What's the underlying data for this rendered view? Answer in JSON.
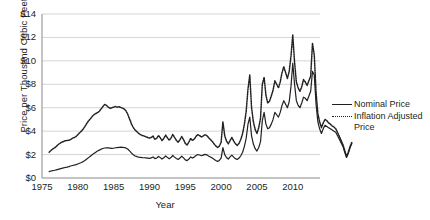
{
  "chart_data": {
    "type": "line",
    "title": "",
    "xlabel": "Year",
    "ylabel": "Price per Thousand Cubic Feet",
    "xlim": [
      1975,
      2013.8
    ],
    "ylim": [
      0,
      14
    ],
    "xticks": [
      1975,
      1980,
      1985,
      1990,
      1995,
      2000,
      2005,
      2010
    ],
    "xtick_labels": [
      "1975",
      "1980",
      "1985",
      "1990",
      "1995",
      "2000",
      "2005",
      "2010"
    ],
    "yticks": [
      0,
      2,
      4,
      6,
      8,
      10,
      12,
      14
    ],
    "ytick_labels": [
      "$0",
      "$2",
      "$4",
      "$6",
      "$8",
      "$10",
      "$12",
      "$14"
    ],
    "grid": "horizontal",
    "legend_position": "right",
    "line_color": "#231f20",
    "grid_color": "#c9c9c9",
    "axis_color": "#8a8a8a",
    "series": [
      {
        "name": "Nominal Price",
        "style": "solid",
        "x_start": 1976.0,
        "x_step": 0.25,
        "values": [
          0.55,
          0.6,
          0.63,
          0.66,
          0.7,
          0.74,
          0.78,
          0.82,
          0.86,
          0.9,
          0.93,
          0.97,
          1.02,
          1.07,
          1.1,
          1.14,
          1.2,
          1.26,
          1.32,
          1.4,
          1.5,
          1.62,
          1.74,
          1.86,
          1.98,
          2.1,
          2.2,
          2.3,
          2.38,
          2.46,
          2.52,
          2.56,
          2.58,
          2.57,
          2.55,
          2.53,
          2.54,
          2.58,
          2.6,
          2.62,
          2.63,
          2.62,
          2.6,
          2.55,
          2.45,
          2.3,
          2.12,
          1.98,
          1.88,
          1.82,
          1.78,
          1.76,
          1.74,
          1.73,
          1.72,
          1.7,
          1.68,
          1.72,
          1.8,
          1.66,
          1.7,
          1.84,
          1.74,
          1.62,
          1.72,
          1.88,
          1.76,
          1.64,
          1.74,
          1.92,
          1.78,
          1.66,
          1.58,
          1.7,
          1.86,
          1.72,
          1.55,
          1.48,
          1.62,
          1.8,
          1.7,
          1.78,
          1.92,
          2.0,
          1.96,
          1.9,
          1.95,
          2.02,
          1.98,
          1.88,
          1.8,
          1.72,
          1.6,
          1.5,
          1.42,
          1.5,
          1.7,
          2.6,
          2.0,
          1.75,
          1.62,
          1.8,
          1.95,
          1.78,
          1.65,
          1.58,
          1.7,
          1.9,
          2.2,
          2.7,
          3.4,
          4.6,
          5.2,
          3.6,
          2.9,
          2.5,
          2.3,
          2.6,
          3.1,
          4.9,
          5.6,
          4.6,
          4.2,
          4.3,
          4.6,
          5.0,
          5.6,
          5.4,
          5.2,
          5.6,
          6.2,
          6.6,
          6.3,
          6.0,
          6.5,
          7.8,
          9.8,
          8.0,
          6.6,
          6.2,
          6.0,
          6.4,
          6.9,
          6.8,
          6.6,
          7.0,
          7.4,
          9.1,
          8.8,
          6.3,
          4.8,
          4.2,
          3.8,
          4.2,
          4.5,
          4.4,
          4.3,
          4.2,
          4.1,
          4.0,
          3.9,
          3.6,
          3.3,
          3.0,
          2.7,
          2.2,
          1.75,
          2.1,
          2.6,
          2.95
        ]
      },
      {
        "name": "Inflation Adjusted Price",
        "style": "dotted",
        "x_start": 1976.0,
        "x_step": 0.25,
        "values": [
          2.2,
          2.35,
          2.48,
          2.56,
          2.7,
          2.85,
          2.96,
          3.05,
          3.12,
          3.18,
          3.2,
          3.22,
          3.28,
          3.4,
          3.46,
          3.54,
          3.7,
          3.86,
          4.0,
          4.18,
          4.4,
          4.66,
          4.88,
          5.05,
          5.25,
          5.4,
          5.5,
          5.58,
          5.7,
          5.9,
          6.1,
          6.28,
          6.2,
          6.05,
          5.95,
          6.0,
          6.05,
          6.1,
          6.05,
          6.08,
          6.02,
          5.96,
          5.88,
          5.7,
          5.4,
          5.0,
          4.6,
          4.3,
          4.1,
          3.95,
          3.8,
          3.7,
          3.62,
          3.58,
          3.52,
          3.46,
          3.4,
          3.46,
          3.58,
          3.3,
          3.38,
          3.62,
          3.44,
          3.2,
          3.38,
          3.66,
          3.44,
          3.22,
          3.4,
          3.72,
          3.46,
          3.22,
          3.06,
          3.26,
          3.54,
          3.28,
          2.96,
          2.82,
          3.06,
          3.38,
          3.2,
          3.32,
          3.56,
          3.7,
          3.62,
          3.5,
          3.58,
          3.7,
          3.62,
          3.44,
          3.28,
          3.14,
          2.92,
          2.74,
          2.6,
          2.72,
          3.05,
          4.8,
          3.62,
          3.16,
          2.92,
          3.2,
          3.46,
          3.16,
          2.92,
          2.78,
          2.96,
          3.3,
          3.8,
          4.6,
          5.7,
          7.6,
          8.8,
          6.0,
          4.8,
          4.15,
          3.8,
          4.3,
          5.1,
          8.0,
          8.6,
          7.1,
          6.4,
          6.55,
          7.0,
          7.5,
          8.3,
          8.0,
          7.7,
          8.2,
          9.0,
          9.5,
          9.0,
          8.5,
          9.1,
          10.4,
          12.2,
          9.9,
          8.2,
          7.7,
          7.4,
          7.8,
          8.4,
          8.2,
          7.9,
          8.3,
          8.7,
          11.5,
          10.5,
          7.3,
          5.5,
          4.8,
          4.3,
          4.7,
          5.0,
          4.9,
          4.7,
          4.6,
          4.45,
          4.35,
          4.2,
          3.9,
          3.55,
          3.2,
          2.85,
          2.35,
          1.85,
          2.2,
          2.7,
          3.05
        ]
      }
    ]
  },
  "legend": {
    "items": [
      {
        "label": "Nominal Price",
        "style": "solid",
        "continuation": ""
      },
      {
        "label": "Inflation Adjusted",
        "style": "dotted",
        "continuation": "Price"
      }
    ]
  }
}
